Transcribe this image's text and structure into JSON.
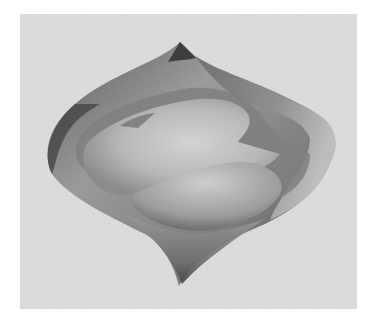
{
  "figure": {
    "colors": {
      "page_background": "#ffffff",
      "panel_background": "#dcdcdc",
      "surface_dark": "#3a3a3a",
      "surface_mid": "#8a8a8a",
      "surface_light": "#d2d2d2"
    }
  }
}
